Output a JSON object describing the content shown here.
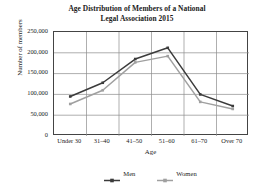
{
  "chart_data": {
    "type": "line",
    "title": "Age Distribution of Members of a National Legal Association 2015",
    "title_lines": [
      "Age Distribution of Members of a National",
      "Legal Association 2015"
    ],
    "xlabel": "Age",
    "ylabel": "Number of members",
    "categories": [
      "Under 30",
      "31–40",
      "41–50",
      "51–60",
      "61–70",
      "Over 70"
    ],
    "ylim": [
      0,
      250000
    ],
    "yticks": [
      0,
      50000,
      100000,
      150000,
      200000,
      250000
    ],
    "ytick_labels": [
      "0",
      "50,000",
      "100,000",
      "150,000",
      "200,000",
      "250,000"
    ],
    "grid": true,
    "legend_position": "bottom",
    "series": [
      {
        "name": "Men",
        "color": "#3b3b3b",
        "values": [
          95000,
          128000,
          185000,
          212000,
          100000,
          72000
        ]
      },
      {
        "name": "Women",
        "color": "#a0a0a0",
        "values": [
          77000,
          110000,
          177000,
          192000,
          82000,
          65000
        ]
      }
    ]
  },
  "legend": {
    "items": [
      {
        "label": "Men",
        "color": "#3b3b3b"
      },
      {
        "label": "Women",
        "color": "#a0a0a0"
      }
    ]
  },
  "colors": {
    "men": "#3b3b3b",
    "women": "#a0a0a0",
    "grid": "#8c8c8c",
    "frame": "#444444",
    "background": "#ffffff"
  }
}
